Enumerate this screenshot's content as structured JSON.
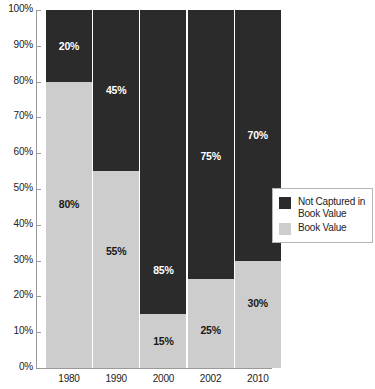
{
  "chart_data": {
    "type": "bar",
    "subtype": "stacked-100-percent",
    "title": "",
    "xlabel": "",
    "ylabel": "",
    "categories": [
      "1980",
      "1990",
      "2000",
      "2002",
      "2010"
    ],
    "series": [
      {
        "name": "Not Captured in Book Value",
        "color": "#2b2b2b",
        "values": [
          20,
          45,
          85,
          75,
          70
        ],
        "labels": [
          "20%",
          "45%",
          "85%",
          "75%",
          "70%"
        ]
      },
      {
        "name": "Book Value",
        "color": "#cdcdcd",
        "values": [
          80,
          55,
          15,
          25,
          30
        ],
        "labels": [
          "80%",
          "55%",
          "15%",
          "25%",
          "30%"
        ]
      }
    ],
    "ylim": [
      0,
      100
    ],
    "ytick_labels": [
      "100%",
      "90%",
      "80%",
      "70%",
      "60%",
      "50%",
      "40%",
      "30%",
      "20%",
      "10%",
      "0%"
    ],
    "ytick_values": [
      100,
      90,
      80,
      70,
      60,
      50,
      40,
      30,
      20,
      10,
      0
    ],
    "grid": false,
    "legend_position": "right"
  },
  "legend": {
    "items": [
      {
        "label": "Not Captured in\nBook Value",
        "color": "#2b2b2b"
      },
      {
        "label": "Book Value",
        "color": "#cdcdcd"
      }
    ]
  },
  "colors": {
    "dark": "#2b2b2b",
    "light": "#cdcdcd",
    "axis": "#9a9a9a",
    "text": "#222222",
    "background": "#ffffff"
  }
}
